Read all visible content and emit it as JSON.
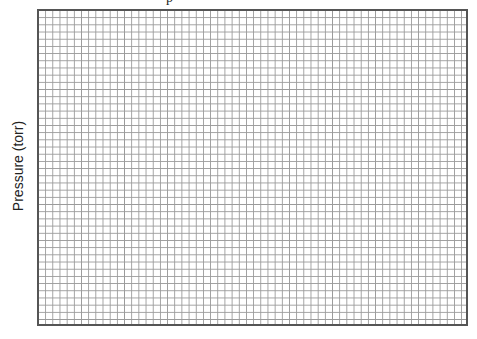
{
  "chart_data": {
    "type": "scatter",
    "title": "",
    "title_fragment": "p",
    "xlabel": "",
    "ylabel": "Pressure (torr)",
    "grid": true,
    "grid_columns": 60,
    "grid_rows": 44,
    "series": [],
    "colors": {
      "border": "#555555",
      "gridline": "#9a9a9a",
      "background": "#ffffff"
    }
  }
}
